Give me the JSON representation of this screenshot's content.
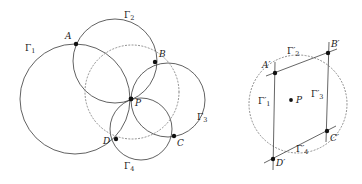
{
  "figure": {
    "caption": "",
    "background_color": "#ffffff",
    "stroke_color": "#3a3a3a",
    "dotted_color": "#8a8a8a",
    "point_color": "#111111"
  },
  "left_diagram": {
    "name": "four-circles-through-common-point",
    "circles": [
      {
        "id": "gamma1",
        "label": "Γ",
        "sub": "1",
        "cx": 75,
        "cy": 99,
        "r": 55,
        "style": "solid"
      },
      {
        "id": "gamma2",
        "label": "Γ",
        "sub": "2",
        "cx": 115,
        "cy": 61,
        "r": 42,
        "style": "solid"
      },
      {
        "id": "gamma3",
        "label": "Γ",
        "sub": "3",
        "cx": 168,
        "cy": 100,
        "r": 37,
        "style": "solid"
      },
      {
        "id": "gamma4",
        "label": "Γ",
        "sub": "4",
        "cx": 141,
        "cy": 129,
        "r": 31,
        "style": "solid"
      },
      {
        "id": "circumcircle",
        "label": "",
        "sub": "",
        "cx": 132,
        "cy": 92,
        "r": 47,
        "style": "dotted"
      }
    ],
    "points": [
      {
        "id": "A",
        "label": "A",
        "x": 76,
        "y": 44,
        "label_dx": -11,
        "label_dy": -12
      },
      {
        "id": "B",
        "label": "B",
        "x": 155,
        "y": 62,
        "label_dx": 4,
        "label_dy": -12
      },
      {
        "id": "C",
        "label": "C",
        "x": 174,
        "y": 136,
        "label_dx": 3,
        "label_dy": 3
      },
      {
        "id": "D",
        "label": "D",
        "x": 116,
        "y": 139,
        "label_dx": -13,
        "label_dy": -2
      },
      {
        "id": "P",
        "label": "P",
        "x": 131,
        "y": 99,
        "label_dx": 4,
        "label_dy": 0
      }
    ],
    "circle_labels": [
      {
        "id": "gamma1-label",
        "label": "Γ",
        "sub": "1",
        "x": 25,
        "y": 44
      },
      {
        "id": "gamma2-label",
        "label": "Γ",
        "sub": "2",
        "x": 124,
        "y": 11
      },
      {
        "id": "gamma3-label",
        "label": "Γ",
        "sub": "3",
        "x": 197,
        "y": 113
      },
      {
        "id": "gamma4-label",
        "label": "Γ",
        "sub": "4",
        "x": 124,
        "y": 162
      }
    ]
  },
  "right_diagram": {
    "name": "image-quadrilateral-under-inversion",
    "dotted_circle": {
      "id": "circumcircle-prime",
      "cx": 298,
      "cy": 104,
      "r": 49,
      "style": "dotted"
    },
    "points": [
      {
        "id": "Aprime",
        "label": "A′",
        "x": 275,
        "y": 73,
        "label_dx": -13,
        "label_dy": -11
      },
      {
        "id": "Bprime",
        "label": "B′",
        "x": 328,
        "y": 53,
        "label_dx": 3,
        "label_dy": -12
      },
      {
        "id": "Cprime",
        "label": "C′",
        "x": 327,
        "y": 131,
        "label_dx": 3,
        "label_dy": 3
      },
      {
        "id": "Dprime",
        "label": "D′",
        "x": 273,
        "y": 159,
        "label_dx": 3,
        "label_dy": 0
      },
      {
        "id": "Pprime",
        "label": "P",
        "x": 291,
        "y": 100,
        "label_dx": 5,
        "label_dy": -2
      }
    ],
    "segments": [
      {
        "id": "line-gamma1-prime",
        "x1": 275,
        "y1": 62,
        "x2": 273,
        "y2": 170
      },
      {
        "id": "line-gamma2-prime",
        "x1": 266,
        "y1": 76,
        "x2": 337,
        "y2": 49
      },
      {
        "id": "line-gamma3-prime",
        "x1": 329,
        "y1": 42,
        "x2": 326,
        "y2": 142
      },
      {
        "id": "line-gamma4-prime",
        "x1": 264,
        "y1": 163,
        "x2": 336,
        "y2": 126
      }
    ],
    "line_labels": [
      {
        "id": "gamma1-prime-label",
        "label": "Γ",
        "sub": "1",
        "prime": "′",
        "x": 260,
        "y": 98
      },
      {
        "id": "gamma2-prime-label",
        "label": "Γ",
        "sub": "2",
        "prime": "′",
        "x": 289,
        "y": 49
      },
      {
        "id": "gamma3-prime-label",
        "label": "Γ",
        "sub": "3",
        "prime": "′",
        "x": 311,
        "y": 91
      },
      {
        "id": "gamma4-prime-label",
        "label": "Γ",
        "sub": "4",
        "prime": "′",
        "x": 298,
        "y": 147
      }
    ]
  }
}
